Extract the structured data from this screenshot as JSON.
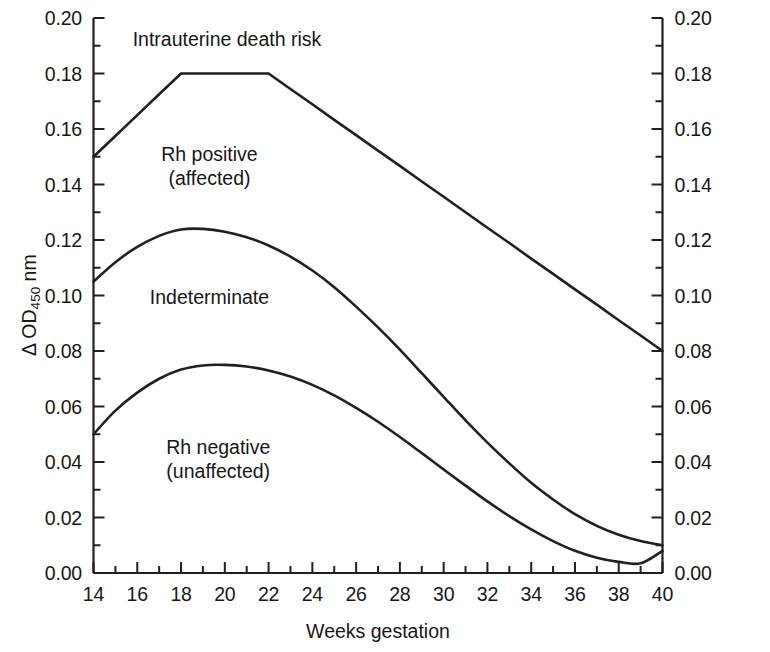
{
  "chart_data": {
    "type": "line",
    "title": "",
    "xlabel": "Weeks gestation",
    "ylabel": "Δ OD450 nm",
    "ylabel_parts": {
      "delta": "Δ",
      "main": " OD",
      "sub": "450",
      "unit": " nm"
    },
    "xlim": [
      14,
      40
    ],
    "ylim": [
      0.0,
      0.2
    ],
    "grid": false,
    "legend": "inline-annotations",
    "xticks": [
      14,
      16,
      18,
      20,
      22,
      24,
      26,
      28,
      30,
      32,
      34,
      36,
      38,
      40
    ],
    "xtick_labels": [
      "14",
      "16",
      "18",
      "20",
      "22",
      "24",
      "26",
      "28",
      "30",
      "32",
      "34",
      "36",
      "38",
      "40"
    ],
    "x_minor_ticks": [
      15,
      17,
      19,
      21,
      23,
      25,
      27,
      29,
      31,
      33,
      35,
      37,
      39
    ],
    "yticks": [
      0.0,
      0.02,
      0.04,
      0.06,
      0.08,
      0.1,
      0.12,
      0.14,
      0.16,
      0.18,
      0.2
    ],
    "ytick_labels": [
      "0.00",
      "0.02",
      "0.04",
      "0.06",
      "0.08",
      "0.10",
      "0.12",
      "0.14",
      "0.16",
      "0.18",
      "0.20"
    ],
    "y_minor_ticks": [
      0.01,
      0.03,
      0.05,
      0.07,
      0.09,
      0.11,
      0.13,
      0.15,
      0.17,
      0.19
    ],
    "right_axis_ticks": [
      0.0,
      0.02,
      0.04,
      0.06,
      0.08,
      0.1,
      0.12,
      0.14,
      0.16,
      0.18,
      0.2
    ],
    "right_axis_tick_labels": [
      "0.00",
      "0.02",
      "0.04",
      "0.06",
      "0.08",
      "0.10",
      "0.12",
      "0.14",
      "0.16",
      "0.18",
      "0.20"
    ],
    "line_color": "#221f1f",
    "line_width": 2.6,
    "series": [
      {
        "name": "upper-boundary",
        "zone_above": "Intrauterine death risk",
        "x": [
          14,
          15,
          16,
          17,
          18,
          19,
          20,
          21,
          22,
          23,
          24,
          25,
          26,
          27,
          28,
          29,
          30,
          31,
          32,
          33,
          34,
          35,
          36,
          37,
          38,
          39,
          40
        ],
        "values": [
          0.15,
          0.1575,
          0.165,
          0.1725,
          0.18,
          0.18,
          0.18,
          0.18,
          0.18,
          0.1744,
          0.1689,
          0.1633,
          0.1578,
          0.1522,
          0.1467,
          0.1411,
          0.1356,
          0.13,
          0.1244,
          0.1189,
          0.1133,
          0.1078,
          0.1022,
          0.0967,
          0.0911,
          0.0856,
          0.08
        ]
      },
      {
        "name": "middle-boundary",
        "zone_above": "Rh positive (affected)",
        "x": [
          14,
          15,
          16,
          17,
          18,
          19,
          20,
          21,
          22,
          23,
          24,
          25,
          26,
          27,
          28,
          29,
          30,
          31,
          32,
          33,
          34,
          35,
          36,
          37,
          38,
          39,
          40
        ],
        "values": [
          0.105,
          0.112,
          0.1175,
          0.1215,
          0.1238,
          0.124,
          0.123,
          0.121,
          0.118,
          0.114,
          0.109,
          0.103,
          0.096,
          0.0885,
          0.0805,
          0.072,
          0.0635,
          0.055,
          0.047,
          0.0395,
          0.0325,
          0.0265,
          0.0212,
          0.017,
          0.0138,
          0.0115,
          0.01
        ]
      },
      {
        "name": "lower-boundary",
        "zone_above": "Indeterminate",
        "zone_below": "Rh negative (unaffected)",
        "x": [
          14,
          15,
          16,
          17,
          18,
          19,
          20,
          21,
          22,
          23,
          24,
          25,
          26,
          27,
          28,
          29,
          30,
          31,
          32,
          33,
          34,
          35,
          36,
          37,
          38,
          39,
          40
        ],
        "values": [
          0.05,
          0.0585,
          0.065,
          0.07,
          0.0733,
          0.0748,
          0.075,
          0.0744,
          0.073,
          0.0708,
          0.0678,
          0.064,
          0.0595,
          0.0545,
          0.049,
          0.0432,
          0.0373,
          0.0315,
          0.0258,
          0.0205,
          0.0157,
          0.0115,
          0.008,
          0.0055,
          0.004,
          0.0035,
          0.008
        ]
      }
    ],
    "annotations": [
      {
        "id": "intrauterine-death-risk",
        "lines": [
          "Intrauterine death risk"
        ],
        "x_week": 20.1,
        "y_value": 0.1925
      },
      {
        "id": "rh-positive-affected",
        "lines": [
          "Rh positive",
          "(affected)"
        ],
        "x_week": 19.3,
        "y_value": 0.151
      },
      {
        "id": "indeterminate",
        "lines": [
          "Indeterminate"
        ],
        "x_week": 19.3,
        "y_value": 0.0995
      },
      {
        "id": "rh-negative-unaffected",
        "lines": [
          "Rh negative",
          "(unaffected)"
        ],
        "x_week": 19.7,
        "y_value": 0.0455
      }
    ]
  },
  "axes": {
    "x_title": "Weeks gestation",
    "y_title_delta": "Δ",
    "y_title_main": " OD",
    "y_title_sub": "450",
    "y_title_unit": " nm"
  }
}
